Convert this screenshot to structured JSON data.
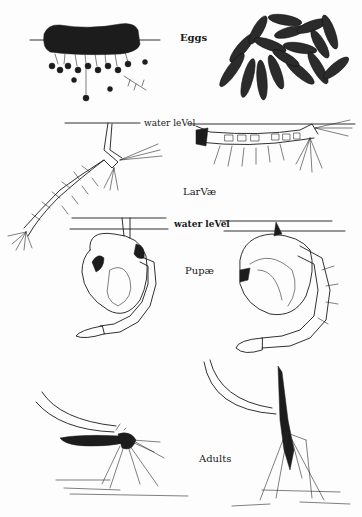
{
  "figure": {
    "colors": {
      "ink": "#1a1a1a",
      "paper": "#fdfdfd"
    },
    "labels": {
      "eggs": "Eggs",
      "water_level_1": "water leVel",
      "larvae": "LarVæ",
      "water_level_2": "water leVel",
      "pupae": "Pupæ",
      "adults": "Adults"
    },
    "stages": [
      {
        "name": "eggs",
        "panels": [
          "egg raft on water surface",
          "individual eggs magnified"
        ]
      },
      {
        "name": "larvae",
        "panels": [
          "larva hanging from surface (angled)",
          "larva lying parallel to surface"
        ]
      },
      {
        "name": "pupae",
        "panels": [
          "pupa at surface (left)",
          "pupa at surface (right)"
        ]
      },
      {
        "name": "adults",
        "panels": [
          "adult resting horizontal",
          "adult resting at steep angle"
        ]
      }
    ]
  }
}
